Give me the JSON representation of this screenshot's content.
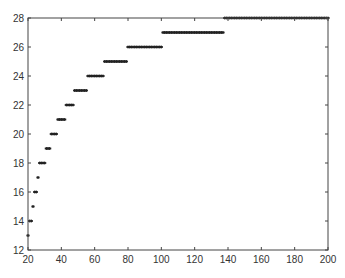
{
  "chart_data": {
    "type": "scatter",
    "title": "",
    "xlabel": "",
    "ylabel": "",
    "xlim": [
      20,
      200
    ],
    "ylim": [
      12,
      28
    ],
    "grid": false,
    "legend": null,
    "xticks": [
      20,
      40,
      60,
      80,
      100,
      120,
      140,
      160,
      180,
      200
    ],
    "yticks": [
      12,
      14,
      16,
      18,
      20,
      22,
      24,
      26,
      28
    ],
    "marker": "*",
    "marker_color": "#222222",
    "series": [
      {
        "name": "data",
        "steps": [
          {
            "y": 13,
            "x_from": 20,
            "x_to": 20
          },
          {
            "y": 14,
            "x_from": 21,
            "x_to": 22
          },
          {
            "y": 15,
            "x_from": 23,
            "x_to": 23
          },
          {
            "y": 16,
            "x_from": 24,
            "x_to": 25
          },
          {
            "y": 17,
            "x_from": 26,
            "x_to": 26
          },
          {
            "y": 18,
            "x_from": 27,
            "x_to": 30
          },
          {
            "y": 19,
            "x_from": 31,
            "x_to": 33
          },
          {
            "y": 20,
            "x_from": 34,
            "x_to": 37
          },
          {
            "y": 21,
            "x_from": 38,
            "x_to": 42
          },
          {
            "y": 22,
            "x_from": 43,
            "x_to": 47
          },
          {
            "y": 23,
            "x_from": 48,
            "x_to": 55
          },
          {
            "y": 24,
            "x_from": 56,
            "x_to": 65
          },
          {
            "y": 25,
            "x_from": 66,
            "x_to": 79
          },
          {
            "y": 26,
            "x_from": 80,
            "x_to": 100
          },
          {
            "y": 27,
            "x_from": 101,
            "x_to": 137
          },
          {
            "y": 28,
            "x_from": 138,
            "x_to": 200
          }
        ]
      }
    ]
  }
}
